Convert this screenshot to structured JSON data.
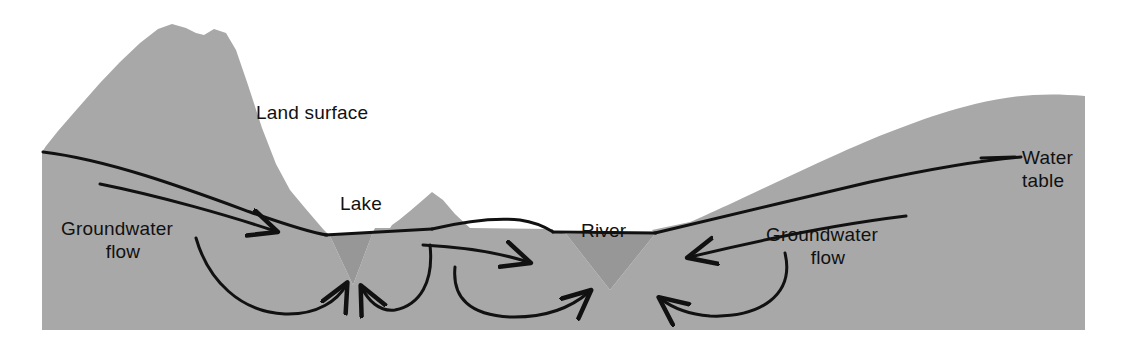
{
  "figure": {
    "type": "diagram",
    "background_color": "#ffffff",
    "terrain_color": "#b2b2b2",
    "water_color": "#979797",
    "line_color": "#111111"
  },
  "labels": {
    "land_surface": "Land surface",
    "lake": "Lake",
    "river": "River",
    "water_table_line1": "Water",
    "water_table_line2": "table",
    "groundwater_left_line1": "Groundwater",
    "groundwater_left_line2": "flow",
    "groundwater_right_line1": "Groundwater",
    "groundwater_right_line2": "flow"
  },
  "features": [
    {
      "name": "land-surface",
      "label": "Land surface",
      "kind": "terrain-outline"
    },
    {
      "name": "water-table",
      "label": "Water table",
      "kind": "line"
    },
    {
      "name": "lake",
      "label": "Lake",
      "kind": "surface-water"
    },
    {
      "name": "river",
      "label": "River",
      "kind": "surface-water"
    },
    {
      "name": "groundwater-flow-left",
      "label": "Groundwater flow",
      "kind": "flow-arrow"
    },
    {
      "name": "groundwater-flow-right",
      "label": "Groundwater flow",
      "kind": "flow-arrow"
    }
  ]
}
